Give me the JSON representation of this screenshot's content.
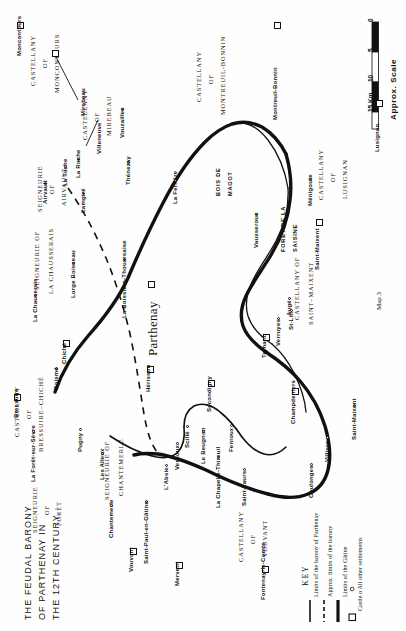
{
  "title": {
    "line1": "THE FEUDAL BARONY",
    "line2": "OF PARTHENAY IN",
    "line3": "THE 12TH CENTURY."
  },
  "caption": "Map 3",
  "scale": {
    "label": "Approx. Scale",
    "ticks": [
      "0",
      "5",
      "10",
      "15 Km"
    ]
  },
  "key": {
    "heading": "KEY",
    "entries": [
      {
        "symbol": "solid-thin-line",
        "label": "Limits of the barony of Parthenay"
      },
      {
        "symbol": "dashed-line",
        "label": "Approx. limits of the barony"
      },
      {
        "symbol": "solid-thick-line",
        "label": "Limits of the Gâtine"
      },
      {
        "symbol": "square-and-circle",
        "label": "Castle  o All other settlements"
      }
    ]
  },
  "regions": [
    {
      "name": "CASTELLANY OF MONCONTOURS",
      "lines": [
        "CASTELLANY",
        "OF",
        "MONCONTOURS"
      ]
    },
    {
      "name": "CASTELLANY OF MIREBEAU",
      "lines": [
        "CASTELLANY",
        "OF",
        "MIREBEAU"
      ]
    },
    {
      "name": "CASTELLANY OF MONTREUIL-BONNIN",
      "lines": [
        "CASTELLANY",
        "OF",
        "MONTREUIL-BONNIN"
      ]
    },
    {
      "name": "CASTELLANY OF LUSIGNAN",
      "lines": [
        "CASTELLANY",
        "OF",
        "LUSIGNAN"
      ]
    },
    {
      "name": "CASTELLANY OF SAINT-MAIXENT",
      "lines": [
        "CASTELLANY  OF",
        "SAINT–MAIXENT"
      ]
    },
    {
      "name": "CASTELLANY OF VOUVANT",
      "lines": [
        "CASTELLANY",
        "OF",
        "VOUVANT"
      ]
    },
    {
      "name": "CASTELLANY OF BRESSUIRE-CHICHE",
      "lines": [
        "CASTELLANY",
        "OF",
        "BRESSUIRE–CHICHÉ"
      ]
    },
    {
      "name": "SEIGNEURIE OF AIRVAULT",
      "lines": [
        "SEIGNEURIE",
        "OF",
        "AIRVAULT"
      ]
    },
    {
      "name": "SEIGNEURIE OF LA CHAUSSERAIS",
      "lines": [
        "SEIGNEURIE  OF",
        "LA  CHAUSSERAIS"
      ]
    },
    {
      "name": "SEIGNEURIE OF FORET",
      "lines": [
        "SEIGNEURIE",
        "OF",
        "FORÊT"
      ]
    },
    {
      "name": "SEIGNEURIE OF CHANTEMERLE",
      "lines": [
        "SEIGNEURIE  OF",
        "CHANTEMERLE"
      ]
    }
  ],
  "forests": [
    {
      "name": "BOIS DE MAGOT",
      "lines": [
        "BOIS DE",
        "MAGOT"
      ]
    },
    {
      "name": "FORET DE LA SAISINE",
      "lines": [
        "FORÊT DE LA",
        "SAISINE"
      ]
    }
  ],
  "castles": [
    {
      "name": "Moncontours"
    },
    {
      "name": "Mirebeau"
    },
    {
      "name": "Montreuil-Bonnin"
    },
    {
      "name": "Lusignan"
    },
    {
      "name": "Saint-Maixent"
    },
    {
      "name": "Parthenay"
    },
    {
      "name": "Bressuire"
    },
    {
      "name": "Chiché"
    },
    {
      "name": "Hérisson"
    },
    {
      "name": "Secondigny"
    },
    {
      "name": "Vouvant"
    },
    {
      "name": "Mervent"
    },
    {
      "name": "Fontenay-le-Comte"
    },
    {
      "name": "Ternant"
    },
    {
      "name": "Champdeniers"
    }
  ],
  "settlements": [
    {
      "name": "Airvault"
    },
    {
      "name": "La Roche"
    },
    {
      "name": "Villeneuve"
    },
    {
      "name": "La Toche"
    },
    {
      "name": "Vouzailles"
    },
    {
      "name": "Thénezay"
    },
    {
      "name": "La Ferrière"
    },
    {
      "name": "Lamgiré"
    },
    {
      "name": "La Boissière-Thouarsaise"
    },
    {
      "name": "Lorge Boisseau"
    },
    {
      "name": "La Chauserais"
    },
    {
      "name": "Boismé"
    },
    {
      "name": "La Forêt-sur-Sèvre"
    },
    {
      "name": "Pugny"
    },
    {
      "name": "Les Alleux"
    },
    {
      "name": "Chantemerle"
    },
    {
      "name": "Saint-Paul-en-Gâtine"
    },
    {
      "name": "L'Absie"
    },
    {
      "name": "Vernoux"
    },
    {
      "name": "Le Beugnon"
    },
    {
      "name": "Scillé"
    },
    {
      "name": "La Chapelle-Thireuil"
    },
    {
      "name": "Fenioux"
    },
    {
      "name": "Saint-Laurs"
    },
    {
      "name": "Coulonges"
    },
    {
      "name": "Villiers"
    },
    {
      "name": "Saint-Maixent"
    },
    {
      "name": "Augé"
    },
    {
      "name": "Verruyes"
    },
    {
      "name": "St-Lin"
    },
    {
      "name": "Vausseroux"
    },
    {
      "name": "Ménigoute"
    }
  ]
}
